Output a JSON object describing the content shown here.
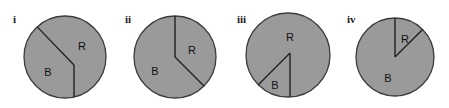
{
  "figure": {
    "title": "",
    "background_color": "#ffffff",
    "width": 449,
    "height": 108
  },
  "style": {
    "pie_fill": "#9a9a9a",
    "pie_stroke": "#3c3c3c",
    "divider_stroke": "#222222",
    "label_color": "#111111",
    "roman_color": "#1a1a1a"
  },
  "chart_data": {
    "type": "pie",
    "title": "",
    "xlabel": "",
    "ylabel": "",
    "legend": [],
    "charts": [
      {
        "id": "i",
        "roman_label": "i",
        "center": {
          "x": 65,
          "y": 57
        },
        "radius": 41,
        "vertex_offset": {
          "x": 9,
          "y": 8
        },
        "categories": [
          "R",
          "B"
        ],
        "values": [
          47,
          53
        ],
        "slices": [
          {
            "label": "R",
            "percent": 47,
            "label_pos": {
              "x": 82,
              "y": 47
            }
          },
          {
            "label": "B",
            "percent": 53,
            "label_pos": {
              "x": 48,
              "y": 73
            }
          }
        ],
        "boundary_angles_deg": [
          134,
          270
        ]
      },
      {
        "id": "ii",
        "roman_label": "ii",
        "center": {
          "x": 175,
          "y": 57
        },
        "radius": 41,
        "vertex_offset": {
          "x": 0,
          "y": 0
        },
        "categories": [
          "R",
          "B"
        ],
        "values": [
          38,
          62
        ],
        "slices": [
          {
            "label": "R",
            "percent": 38,
            "label_pos": {
              "x": 192,
              "y": 51
            }
          },
          {
            "label": "B",
            "percent": 62,
            "label_pos": {
              "x": 155,
              "y": 72
            }
          }
        ],
        "boundary_angles_deg": [
          90,
          315
        ]
      },
      {
        "id": "iii",
        "roman_label": "iii",
        "center": {
          "x": 288,
          "y": 55
        },
        "radius": 42,
        "vertex_offset": {
          "x": 2,
          "y": -2
        },
        "categories": [
          "R",
          "B"
        ],
        "values": [
          88,
          12
        ],
        "slices": [
          {
            "label": "R",
            "percent": 88,
            "label_pos": {
              "x": 290,
              "y": 38
            }
          },
          {
            "label": "B",
            "percent": 12,
            "label_pos": {
              "x": 275,
              "y": 86
            }
          }
        ],
        "boundary_angles_deg": [
          225,
          270
        ]
      },
      {
        "id": "iv",
        "roman_label": "iv",
        "center": {
          "x": 395,
          "y": 57
        },
        "radius": 39,
        "vertex_offset": {
          "x": 0,
          "y": 0
        },
        "categories": [
          "R",
          "B"
        ],
        "values": [
          13,
          87
        ],
        "slices": [
          {
            "label": "R",
            "percent": 13,
            "label_pos": {
              "x": 405,
              "y": 40
            }
          },
          {
            "label": "B",
            "percent": 87,
            "label_pos": {
              "x": 388,
              "y": 79
            }
          }
        ],
        "boundary_angles_deg": [
          90,
          45
        ]
      }
    ]
  },
  "roman_labels": [
    {
      "text": "i",
      "x": 13,
      "y": 14
    },
    {
      "text": "ii",
      "x": 125,
      "y": 14
    },
    {
      "text": "iii",
      "x": 237,
      "y": 14
    },
    {
      "text": "iv",
      "x": 347,
      "y": 14
    }
  ]
}
